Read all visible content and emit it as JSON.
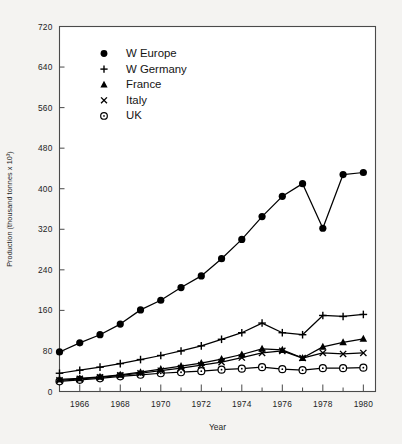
{
  "chart_data": {
    "type": "line",
    "title": "",
    "xlabel": "Year",
    "ylabel": "Production (thousand tonnes x 10³)",
    "xlim": [
      1965,
      1980.6
    ],
    "ylim": [
      0,
      720
    ],
    "yticks": [
      0,
      80,
      160,
      240,
      320,
      400,
      480,
      560,
      640,
      720
    ],
    "ytick_labels": [
      "0",
      "80",
      "160",
      "240",
      "320",
      "400",
      "480",
      "560",
      "640",
      "720"
    ],
    "xticks": [
      1966,
      1968,
      1970,
      1972,
      1974,
      1976,
      1978,
      1980
    ],
    "xtick_labels": [
      "1966",
      "1968",
      "1970",
      "1972",
      "1974",
      "1976",
      "1978",
      "1980"
    ],
    "xticks_minor": [
      1965,
      1967,
      1969,
      1971,
      1973,
      1975,
      1977,
      1979
    ],
    "grid": false,
    "legend_position": "upper-left-inside",
    "x": [
      1965,
      1966,
      1967,
      1968,
      1969,
      1970,
      1971,
      1972,
      1973,
      1974,
      1975,
      1976,
      1977,
      1978,
      1979,
      1980
    ],
    "series": [
      {
        "name": "W Europe",
        "marker": "filled-circle",
        "values": [
          78,
          96,
          112,
          133,
          161,
          180,
          205,
          228,
          262,
          300,
          345,
          385,
          410,
          322,
          428,
          432
        ]
      },
      {
        "name": "W Germany",
        "marker": "plus",
        "values": [
          36,
          42,
          48,
          55,
          63,
          71,
          80,
          90,
          103,
          116,
          135,
          116,
          112,
          150,
          148,
          152
        ]
      },
      {
        "name": "France",
        "marker": "filled-triangle",
        "values": [
          24,
          26,
          29,
          33,
          38,
          44,
          50,
          56,
          64,
          73,
          84,
          82,
          66,
          88,
          97,
          104
        ]
      },
      {
        "name": "Italy",
        "marker": "cross",
        "values": [
          22,
          25,
          28,
          32,
          36,
          41,
          46,
          52,
          58,
          67,
          76,
          80,
          66,
          76,
          74,
          76
        ]
      },
      {
        "name": "UK",
        "marker": "open-circle",
        "values": [
          20,
          23,
          26,
          30,
          33,
          36,
          38,
          40,
          43,
          45,
          48,
          44,
          42,
          46,
          46,
          47
        ]
      }
    ],
    "annotations": []
  },
  "chart": {
    "ylabel": "Production (thousand tonnes x 10³)",
    "xlabel": "Year",
    "legend": {
      "items": [
        {
          "label": "W Europe",
          "marker": "filled-circle"
        },
        {
          "label": "W Germany",
          "marker": "plus"
        },
        {
          "label": "France",
          "marker": "filled-triangle"
        },
        {
          "label": "Italy",
          "marker": "cross"
        },
        {
          "label": "UK",
          "marker": "open-circle"
        }
      ]
    },
    "colors": {
      "ink": "#000000",
      "frame": "#4a4a4a",
      "background": "#f4f3f1",
      "plot_background": "#ffffff"
    }
  }
}
